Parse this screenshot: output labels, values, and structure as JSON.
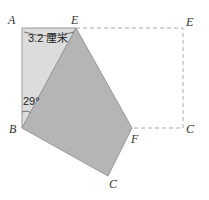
{
  "diagram": {
    "labels": {
      "A": "A",
      "E": "E",
      "E_orig": "E",
      "B": "B",
      "C_orig": "C",
      "F": "F",
      "C_folded": "C"
    },
    "measure_AE": "3.2 厘米",
    "angle_ABE": "29°",
    "colors": {
      "light_region": "#d9d9d9",
      "folded_region": "#b3b3b3",
      "dashed_line": "#aaaaaa",
      "edge": "#888888"
    }
  }
}
